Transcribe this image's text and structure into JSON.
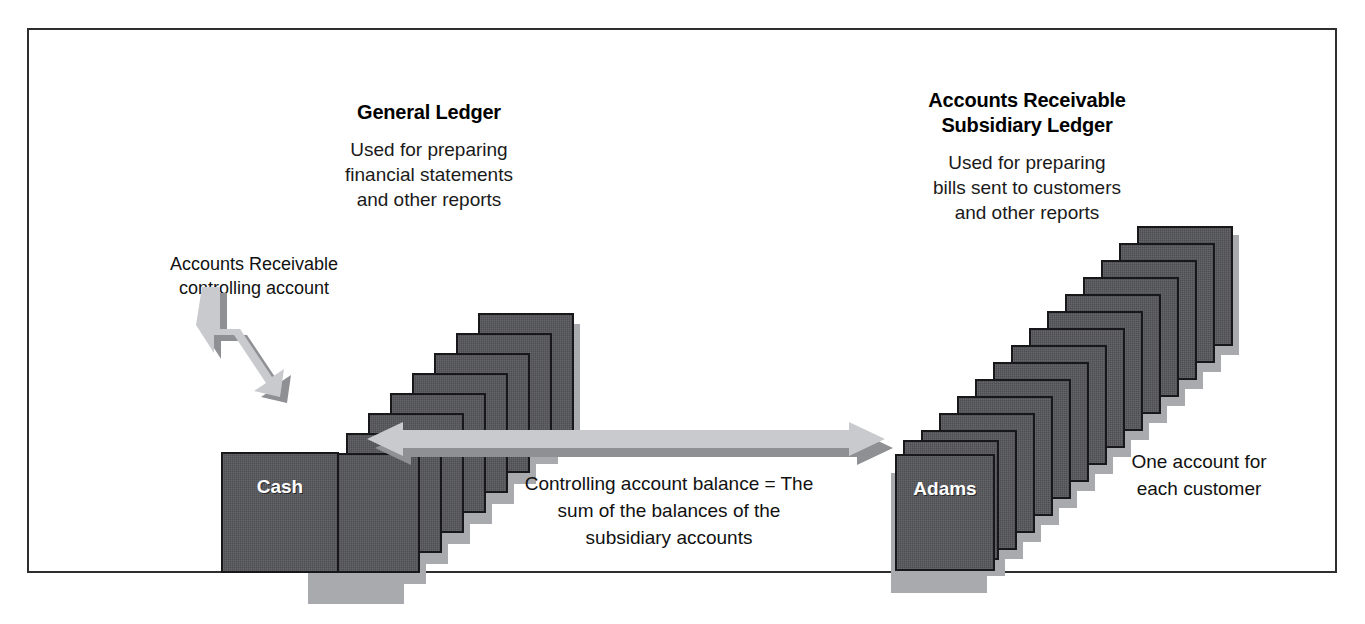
{
  "figure": {
    "border_color": "#2e2e2e",
    "background": "#ffffff",
    "card_color": "#55565a",
    "card_shadow_color": "#a9aaad",
    "arrow_color": "#c9cacd",
    "arrow_shadow_color": "#8e9094"
  },
  "general_ledger": {
    "title": "General Ledger",
    "description_line1": "Used for preparing",
    "description_line2": "financial statements",
    "description_line3": "and other reports",
    "front_card_label": "Cash",
    "card_count": 9
  },
  "subsidiary_ledger": {
    "title_line1": "Accounts Receivable",
    "title_line2": "Subsidiary Ledger",
    "description_line1": "Used for preparing",
    "description_line2": "bills sent to customers",
    "description_line3": "and other reports",
    "front_card_label": "Adams",
    "card_count": 15
  },
  "callout": {
    "line1": "Accounts Receivable",
    "line2": "controlling account"
  },
  "center_caption": {
    "line1": "Controlling account balance = The",
    "line2": "sum of the balances of the",
    "line3": "subsidiary accounts"
  },
  "right_caption": {
    "line1": "One account for",
    "line2": "each customer"
  }
}
